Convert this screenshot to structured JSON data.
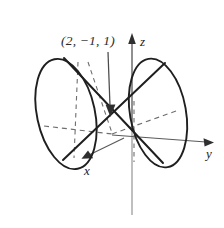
{
  "figure": {
    "background_color": "#ffffff",
    "stroke_color": "#1f1f1f",
    "axis_color": "#5a5a5a",
    "dashed_color": "#6e6e6e",
    "annotation": {
      "point_label": "(2, −1, 1)",
      "coordinates": [
        2,
        -1,
        1
      ],
      "arrow": "points-down-to-cone-vertex"
    },
    "axes": [
      {
        "name": "x",
        "label": "x",
        "direction": "down-left",
        "arrowhead": true
      },
      {
        "name": "y",
        "label": "y",
        "direction": "right",
        "arrowhead": true
      },
      {
        "name": "z",
        "label": "z",
        "direction": "up",
        "arrowhead": true
      }
    ],
    "shapes": [
      {
        "name": "left-nappe-ellipse",
        "type": "ellipse",
        "style": "solid"
      },
      {
        "name": "right-nappe-ellipse",
        "type": "ellipse",
        "style": "solid"
      },
      {
        "name": "cone-generator-upper",
        "type": "line",
        "style": "solid"
      },
      {
        "name": "cone-generator-lower",
        "type": "line",
        "style": "solid"
      },
      {
        "name": "hidden-edges",
        "type": "line",
        "style": "dashed"
      }
    ]
  },
  "icons": {
    "arrow_down": "arrow-down-icon",
    "arrow_right": "arrow-right-icon",
    "arrow_up": "arrow-up-icon",
    "arrow_down_left": "arrow-down-left-icon"
  }
}
